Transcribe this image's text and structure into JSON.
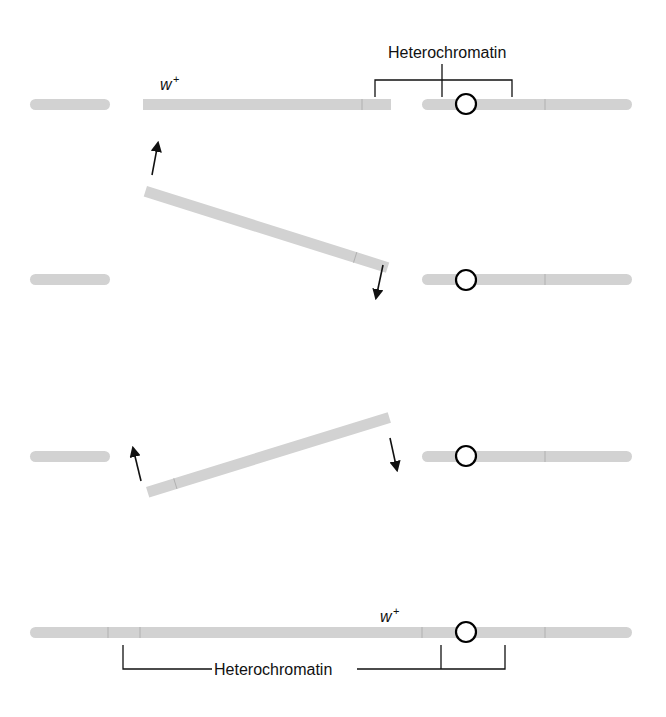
{
  "diagram": {
    "labels": {
      "heterochromatin_top": "Heterochromatin",
      "heterochromatin_bottom": "Heterochromatin",
      "gene_top": "w",
      "gene_top_sup": "+",
      "gene_bottom": "w",
      "gene_bottom_sup": "+"
    },
    "steps": [
      {
        "name": "original-chromosome-with-breaks"
      },
      {
        "name": "segment-rotating"
      },
      {
        "name": "segment-reinserting-inverted"
      },
      {
        "name": "inverted-chromosome"
      }
    ],
    "colors": {
      "chromosome": "#d2d2d2",
      "line": "#111111",
      "background": "#ffffff"
    }
  }
}
